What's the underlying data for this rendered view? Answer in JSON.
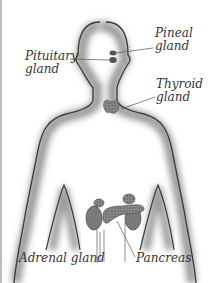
{
  "diagram": {
    "labels": {
      "pineal": [
        "Pineal",
        "gland"
      ],
      "pituitary": [
        "Pituitary",
        "gland"
      ],
      "thyroid": [
        "Thyroid",
        "gland"
      ],
      "adrenal": "Adrenal gland",
      "pancreas": "Pancreas"
    },
    "colors": {
      "outline": "#3a3a3a",
      "shadow": "#9a9a9a",
      "gland": "#6b6b6b",
      "text": "#333333",
      "border": "#bdbdbd"
    }
  }
}
